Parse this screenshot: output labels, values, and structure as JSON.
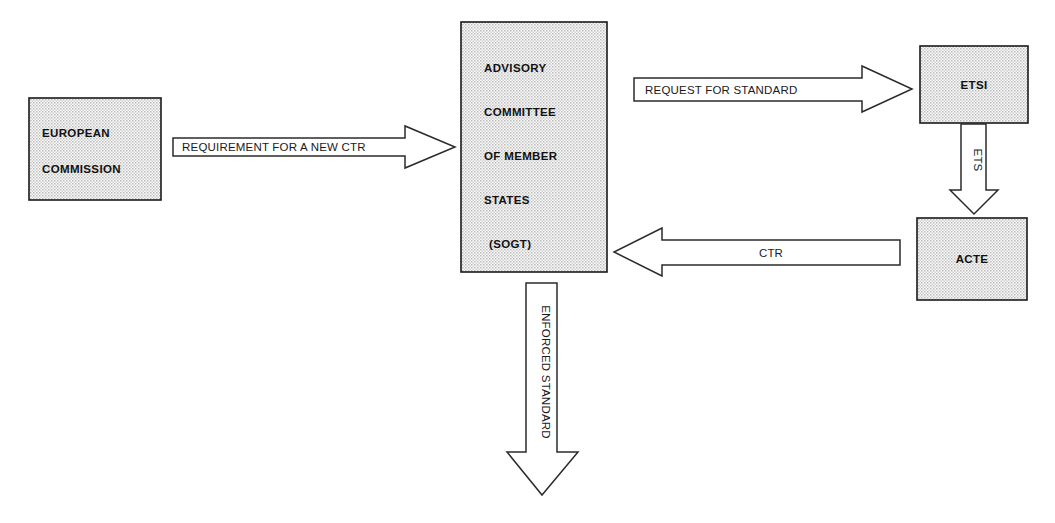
{
  "diagram": {
    "background_color": "#ffffff",
    "box_fill_color": "#e6e6e6",
    "line_color": "#1a1a1a",
    "nodes": [
      {
        "id": "european-commission",
        "lines": [
          "EUROPEAN",
          "COMMISSION"
        ],
        "x": 29,
        "y": 98,
        "w": 132,
        "h": 102
      },
      {
        "id": "advisory-committee",
        "lines": [
          "ADVISORY",
          "COMMITTEE",
          "OF MEMBER",
          "STATES",
          "(SOGT)"
        ],
        "x": 461,
        "y": 22,
        "w": 146,
        "h": 250
      },
      {
        "id": "etsi",
        "lines": [
          "ETSI"
        ],
        "x": 920,
        "y": 46,
        "w": 108,
        "h": 77
      },
      {
        "id": "acte",
        "lines": [
          "ACTE"
        ],
        "x": 917,
        "y": 218,
        "w": 110,
        "h": 82
      }
    ],
    "arrows": [
      {
        "id": "requirement-for-new-ctr",
        "label": "REQUIREMENT FOR A NEW CTR",
        "direction": "right",
        "from": "european-commission",
        "to": "advisory-committee"
      },
      {
        "id": "request-for-standard",
        "label": "REQUEST FOR STANDARD",
        "direction": "right",
        "from": "advisory-committee",
        "to": "etsi"
      },
      {
        "id": "ets",
        "label": "ETS",
        "direction": "down",
        "from": "etsi",
        "to": "acte"
      },
      {
        "id": "ctr",
        "label": "CTR",
        "direction": "left",
        "from": "acte",
        "to": "advisory-committee"
      },
      {
        "id": "enforced-standard",
        "label": "ENFORCED STANDARD",
        "direction": "down",
        "from": "advisory-committee",
        "to": ""
      }
    ]
  }
}
